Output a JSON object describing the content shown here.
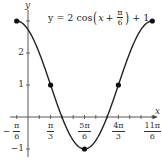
{
  "chart_data": {
    "type": "line",
    "equation": {
      "prefix": "y = 2 cos",
      "var": "x",
      "plus": "+",
      "frac_num": "π",
      "frac_den": "6",
      "suffix": "+ 1"
    },
    "xlabel": "x",
    "ylabel": "y",
    "xlim": [
      -0.5236,
      5.76
    ],
    "ylim": [
      -1,
      3
    ],
    "x_ticks": [
      {
        "num": "π",
        "den": "6",
        "sign": "−",
        "value": -0.5236
      },
      {
        "num": "π",
        "den": "3",
        "sign": "",
        "value": 1.0472
      },
      {
        "num": "5π",
        "den": "6",
        "sign": "",
        "value": 2.618
      },
      {
        "num": "4π",
        "den": "3",
        "sign": "",
        "value": 4.1888
      },
      {
        "num": "11π",
        "den": "6",
        "sign": "",
        "value": 5.7596
      }
    ],
    "y_ticks": [
      {
        "label": "2",
        "value": 2
      },
      {
        "label": "1",
        "value": 1
      },
      {
        "label": "−1",
        "value": -1
      }
    ],
    "key_points": [
      {
        "x": "-π/6",
        "y": 3
      },
      {
        "x": "π/3",
        "y": 1
      },
      {
        "x": "5π/6",
        "y": -1
      },
      {
        "x": "4π/3",
        "y": 1
      },
      {
        "x": "11π/6",
        "y": 3
      }
    ],
    "grid": false,
    "line_color": "#222222",
    "point_color": "#111111"
  }
}
